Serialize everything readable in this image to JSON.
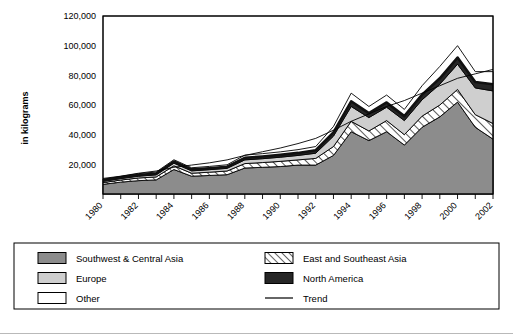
{
  "chart_data": {
    "type": "area",
    "title": "",
    "xlabel": "",
    "ylabel": "in kilograms",
    "ylim": [
      0,
      120000
    ],
    "ytick_labels": [
      "120,000",
      "100,000",
      "80,000",
      "60,000",
      "40,000",
      "20,000"
    ],
    "ytick_values": [
      120000,
      100000,
      80000,
      60000,
      40000,
      20000
    ],
    "grid": true,
    "stacked": true,
    "legend_position": "bottom",
    "x": [
      1980,
      1981,
      1982,
      1983,
      1984,
      1985,
      1986,
      1987,
      1988,
      1989,
      1990,
      1991,
      1992,
      1993,
      1994,
      1995,
      1996,
      1997,
      1998,
      1999,
      2000,
      2001,
      2002
    ],
    "xtick_labels": [
      "1980",
      "",
      "1982",
      "",
      "1984",
      "",
      "1986",
      "",
      "1988",
      "",
      "1990",
      "",
      "1992",
      "",
      "1994",
      "",
      "1996",
      "",
      "1998",
      "",
      "2000",
      "",
      "2002"
    ],
    "xtick_labels_shown": [
      "1980",
      "1982",
      "1984",
      "1986",
      "1988",
      "1990",
      "1992",
      "1994",
      "1996",
      "1998",
      "2000",
      "2002"
    ],
    "series": [
      {
        "name": "Southwest & Central Asia",
        "color": "#8c8c8c",
        "pattern": "solid",
        "values": [
          6500,
          8000,
          9000,
          9500,
          16500,
          12000,
          12500,
          13000,
          17500,
          18000,
          18500,
          19500,
          19500,
          26000,
          42000,
          36000,
          42000,
          33000,
          45000,
          52000,
          62000,
          45000,
          37000
        ]
      },
      {
        "name": "East and Southeast Asia",
        "color": "#ffffff",
        "pattern": "hatch",
        "values": [
          1200,
          1400,
          1800,
          2000,
          2500,
          2000,
          2200,
          2500,
          3000,
          3200,
          3500,
          3500,
          4500,
          6000,
          7000,
          6500,
          7500,
          7000,
          7500,
          8000,
          8500,
          8500,
          10500
        ]
      },
      {
        "name": "Europe",
        "color": "#cfcfcf",
        "pattern": "solid",
        "values": [
          900,
          1000,
          1200,
          1400,
          1800,
          1600,
          1700,
          1800,
          2500,
          2600,
          2800,
          3000,
          3500,
          7000,
          10000,
          9000,
          9000,
          9500,
          11000,
          14000,
          17000,
          18000,
          22000
        ]
      },
      {
        "name": "North America",
        "color": "#262626",
        "pattern": "solid",
        "values": [
          600,
          700,
          800,
          900,
          1100,
          1000,
          1000,
          1100,
          1400,
          1500,
          1600,
          1700,
          2000,
          2500,
          3500,
          3000,
          3200,
          3000,
          3500,
          4000,
          4500,
          4000,
          4500
        ]
      },
      {
        "name": "Other",
        "color": "#ffffff",
        "pattern": "solid",
        "values": [
          700,
          800,
          900,
          1000,
          1200,
          1100,
          1200,
          1300,
          1800,
          1900,
          2000,
          2200,
          2500,
          4000,
          5500,
          4500,
          5000,
          4500,
          6000,
          8000,
          8000,
          7000,
          8500
        ]
      }
    ],
    "trend": {
      "name": "Trend",
      "color": "#000000",
      "values": [
        10500,
        12000,
        14000,
        15500,
        18000,
        19500,
        21000,
        23000,
        26000,
        28500,
        31000,
        34000,
        37500,
        43000,
        49000,
        54000,
        59000,
        63000,
        68000,
        73000,
        78000,
        81000,
        84000
      ]
    },
    "legend": [
      {
        "label": "Southwest & Central Asia",
        "swatch": "dark-gray-fill",
        "color": "#8c8c8c"
      },
      {
        "label": "East and Southeast Asia",
        "swatch": "hatch-fill",
        "color": "#ffffff"
      },
      {
        "label": "Europe",
        "swatch": "light-gray-fill",
        "color": "#cfcfcf"
      },
      {
        "label": "North America",
        "swatch": "black-fill",
        "color": "#262626"
      },
      {
        "label": "Other",
        "swatch": "white-fill",
        "color": "#ffffff"
      },
      {
        "label": "Trend",
        "swatch": "line",
        "color": "#000000"
      }
    ]
  }
}
